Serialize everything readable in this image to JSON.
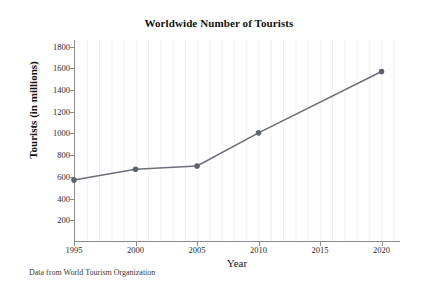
{
  "figure": {
    "caption": "Data from World Tourism Organization",
    "background_color": "#ffffff"
  },
  "chart_data": {
    "type": "line",
    "title": "Worldwide Number of Tourists",
    "xlabel": "Year",
    "ylabel": "Tourists (in millions)",
    "x": [
      1995,
      2000,
      2005,
      2010,
      2020
    ],
    "values": [
      570,
      670,
      700,
      1005,
      1570
    ],
    "series": [
      {
        "name": "Worldwide tourists",
        "x": [
          1995,
          2000,
          2005,
          2010,
          2020
        ],
        "values": [
          570,
          670,
          700,
          1005,
          1570
        ],
        "line_color": "#6b6f78",
        "marker_color": "#5e636c",
        "marker": "circle"
      }
    ],
    "xlim": [
      1995,
      2021.5
    ],
    "ylim": [
      0,
      1860
    ],
    "xticks": [
      1995,
      2000,
      2005,
      2010,
      2015,
      2020
    ],
    "xticklabels": [
      "1995",
      "2000",
      "2005",
      "2010",
      "2015",
      "2020"
    ],
    "yticks": [
      200,
      400,
      600,
      800,
      1000,
      1200,
      1400,
      1600,
      1800
    ],
    "yticklabels": [
      "200",
      "400",
      "600",
      "800",
      "1000",
      "1200",
      "1400",
      "1600",
      "1800"
    ],
    "grid": "minor-vertical-only",
    "grid_color": "#f0f0f2",
    "legend": "none",
    "spines": [
      "left",
      "bottom"
    ],
    "axis_color": "#8b8b8b"
  }
}
